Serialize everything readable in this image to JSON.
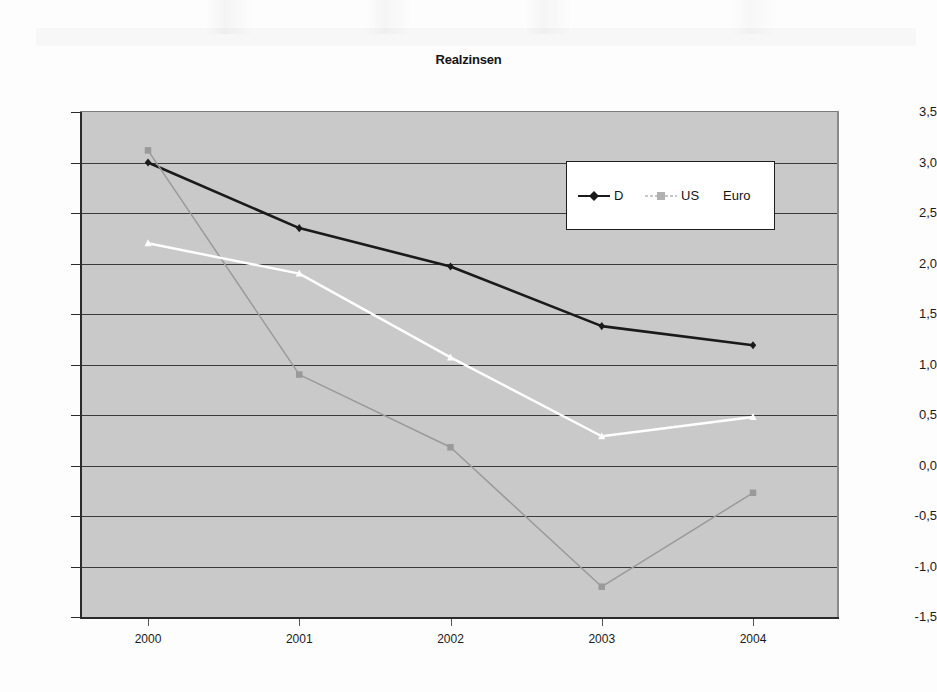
{
  "chart_data": {
    "type": "line",
    "title": "Realzinsen",
    "xlabel": "",
    "ylabel": "",
    "categories": [
      "2000",
      "2001",
      "2002",
      "2003",
      "2004"
    ],
    "series": [
      {
        "name": "D",
        "color": "#1a1a1a",
        "marker": "diamond",
        "values": [
          3.0,
          2.35,
          1.97,
          1.38,
          1.19
        ]
      },
      {
        "name": "US",
        "color": "#9a9a9a",
        "marker": "square",
        "values": [
          3.12,
          0.9,
          0.18,
          -1.2,
          -0.27
        ]
      },
      {
        "name": "Euro",
        "color": "#ffffff",
        "marker": "triangle",
        "values": [
          2.2,
          1.9,
          1.07,
          0.29,
          0.48
        ]
      }
    ],
    "ylim": [
      -1.5,
      3.5
    ],
    "ytick_values": [
      3.5,
      3.0,
      2.5,
      2.0,
      1.5,
      1.0,
      0.5,
      0.0,
      -0.5,
      -1.0,
      -1.5
    ],
    "ytick_labels": [
      "3,5",
      "3,0",
      "2,5",
      "2,0",
      "1,5",
      "1,0",
      "0,5",
      "0,0",
      "-0,5",
      "-1,0",
      "-1,5"
    ],
    "grid": true,
    "legend_position": "upper-right-inside",
    "plot_background": "#c9c9c9",
    "figure_background": "#ffffff"
  },
  "legend": {
    "entries": [
      {
        "label": "D"
      },
      {
        "label": "US"
      },
      {
        "label": "Euro"
      }
    ]
  }
}
